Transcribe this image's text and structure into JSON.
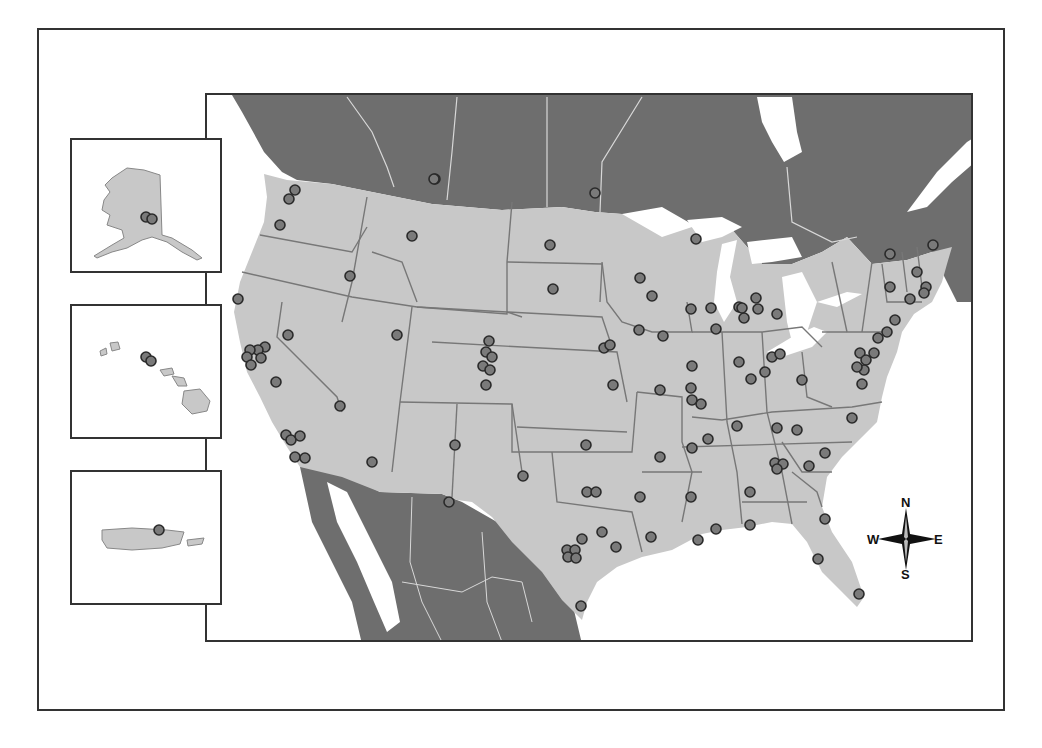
{
  "map": {
    "type": "point-location-map",
    "region": "United States with inset territories",
    "colors": {
      "us_land": "#c8c8c8",
      "foreign_land": "#6e6e6e",
      "water": "#ffffff",
      "state_borders": "#777777",
      "foreign_borders": "#d8d8d8",
      "marker_fill": "#7a7a7a",
      "marker_stroke": "#2a2a2a",
      "frame": "#333333"
    },
    "compass": {
      "north": "N",
      "south": "S",
      "east": "E",
      "west": "W"
    },
    "insets": [
      {
        "name": "Alaska",
        "marker_count": 2
      },
      {
        "name": "Hawaii",
        "marker_count": 2
      },
      {
        "name": "Puerto Rico",
        "marker_count": 1
      }
    ],
    "markers_main_map_px": [
      [
        433,
        177
      ],
      [
        593,
        191
      ],
      [
        293,
        188
      ],
      [
        287,
        197
      ],
      [
        278,
        223
      ],
      [
        410,
        234
      ],
      [
        548,
        243
      ],
      [
        348,
        274
      ],
      [
        551,
        287
      ],
      [
        236,
        297
      ],
      [
        286,
        333
      ],
      [
        395,
        333
      ],
      [
        487,
        339
      ],
      [
        484,
        350
      ],
      [
        490,
        355
      ],
      [
        481,
        364
      ],
      [
        488,
        368
      ],
      [
        484,
        383
      ],
      [
        263,
        345
      ],
      [
        256,
        348
      ],
      [
        248,
        348
      ],
      [
        245,
        355
      ],
      [
        259,
        356
      ],
      [
        249,
        363
      ],
      [
        274,
        380
      ],
      [
        338,
        404
      ],
      [
        284,
        433
      ],
      [
        289,
        438
      ],
      [
        298,
        434
      ],
      [
        293,
        455
      ],
      [
        303,
        456
      ],
      [
        370,
        460
      ],
      [
        453,
        443
      ],
      [
        447,
        500
      ],
      [
        432,
        177
      ],
      [
        694,
        237
      ],
      [
        638,
        276
      ],
      [
        650,
        294
      ],
      [
        637,
        328
      ],
      [
        661,
        334
      ],
      [
        602,
        346
      ],
      [
        608,
        343
      ],
      [
        689,
        307
      ],
      [
        709,
        306
      ],
      [
        714,
        327
      ],
      [
        737,
        305
      ],
      [
        754,
        296
      ],
      [
        742,
        316
      ],
      [
        756,
        307
      ],
      [
        775,
        312
      ],
      [
        740,
        306
      ],
      [
        888,
        252
      ],
      [
        931,
        243
      ],
      [
        888,
        285
      ],
      [
        915,
        270
      ],
      [
        924,
        285
      ],
      [
        922,
        291
      ],
      [
        908,
        297
      ],
      [
        893,
        318
      ],
      [
        885,
        330
      ],
      [
        876,
        336
      ],
      [
        872,
        351
      ],
      [
        858,
        351
      ],
      [
        864,
        358
      ],
      [
        862,
        368
      ],
      [
        855,
        365
      ],
      [
        860,
        382
      ],
      [
        690,
        364
      ],
      [
        737,
        360
      ],
      [
        770,
        355
      ],
      [
        763,
        370
      ],
      [
        778,
        352
      ],
      [
        749,
        377
      ],
      [
        800,
        378
      ],
      [
        658,
        388
      ],
      [
        611,
        383
      ],
      [
        689,
        386
      ],
      [
        699,
        402
      ],
      [
        735,
        424
      ],
      [
        775,
        426
      ],
      [
        795,
        428
      ],
      [
        706,
        437
      ],
      [
        850,
        416
      ],
      [
        690,
        446
      ],
      [
        584,
        443
      ],
      [
        658,
        455
      ],
      [
        773,
        461
      ],
      [
        781,
        462
      ],
      [
        775,
        467
      ],
      [
        807,
        464
      ],
      [
        823,
        451
      ],
      [
        521,
        474
      ],
      [
        585,
        490
      ],
      [
        594,
        490
      ],
      [
        638,
        495
      ],
      [
        689,
        495
      ],
      [
        748,
        490
      ],
      [
        823,
        517
      ],
      [
        816,
        557
      ],
      [
        600,
        530
      ],
      [
        580,
        537
      ],
      [
        614,
        545
      ],
      [
        565,
        548
      ],
      [
        573,
        548
      ],
      [
        566,
        555
      ],
      [
        574,
        556
      ],
      [
        714,
        527
      ],
      [
        748,
        523
      ],
      [
        649,
        535
      ],
      [
        696,
        538
      ],
      [
        579,
        604
      ],
      [
        857,
        592
      ],
      [
        690,
        398
      ]
    ]
  }
}
